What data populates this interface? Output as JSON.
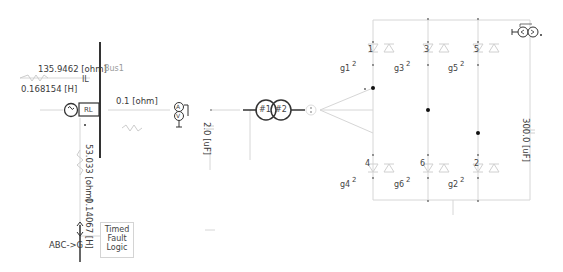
{
  "diagram": {
    "bus": {
      "label": "Bus1"
    },
    "source": {
      "series_resistance": "135.9462 [ohm]",
      "series_inductance": "0.168154 [H]",
      "current_label": "IL",
      "source_block_label": "RL"
    },
    "line_resistance": "0.1 [ohm]",
    "fault_branch": {
      "resistance": "53.033 [ohm]",
      "inductance": "0.14067 [H]",
      "fault_type": "ABC->G",
      "logic_block": [
        "Timed",
        "Fault",
        "Logic"
      ]
    },
    "meter": {
      "ammeter": "A",
      "voltmeter": "V"
    },
    "capacitor_ac": "2.0 [uF]",
    "transformer": {
      "winding1": "#1",
      "winding2": "#2"
    },
    "dc_capacitor": "300.0 [uF]",
    "thyristors_top": [
      {
        "number": "1",
        "gate": "g1",
        "gate_sub": "2"
      },
      {
        "number": "3",
        "gate": "g3",
        "gate_sub": "2"
      },
      {
        "number": "5",
        "gate": "g5",
        "gate_sub": "2"
      }
    ],
    "thyristors_bottom": [
      {
        "number": "4",
        "gate": "g4",
        "gate_sub": "2"
      },
      {
        "number": "6",
        "gate": "g6",
        "gate_sub": "2"
      },
      {
        "number": "2",
        "gate": "g2",
        "gate_sub": "2"
      }
    ],
    "colors": {
      "wire": "#cfcfcf",
      "component": "#333333",
      "faint_component": "#d8d8d8",
      "label": "#3a3a3a"
    }
  }
}
